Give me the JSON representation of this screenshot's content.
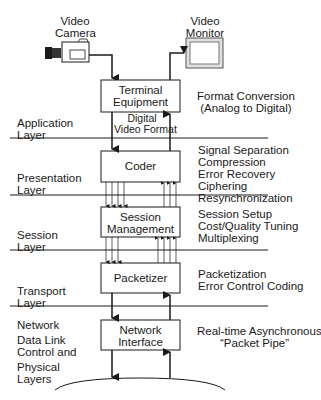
{
  "devices": {
    "camera": {
      "label_line1": "Video",
      "label_line2": "Camera",
      "icon": "video-camera-icon"
    },
    "monitor": {
      "label_line1": "Video",
      "label_line2": "Monitor",
      "icon": "video-monitor-icon"
    }
  },
  "boxes": [
    {
      "id": "terminal-equipment",
      "line1": "Terminal",
      "line2": "Equipment"
    },
    {
      "id": "coder",
      "line1": "Coder",
      "line2": ""
    },
    {
      "id": "session-management",
      "line1": "Session",
      "line2": "Management"
    },
    {
      "id": "packetizer",
      "line1": "Packetizer",
      "line2": ""
    },
    {
      "id": "network-interface",
      "line1": "Network",
      "line2": "Interface"
    }
  ],
  "connector_labels": {
    "digital_video_format_line1": "Digital",
    "digital_video_format_line2": "Video Format"
  },
  "layers": [
    {
      "line1": "Application",
      "line2": "Layer"
    },
    {
      "line1": "Presentation",
      "line2": "Layer"
    },
    {
      "line1": "Session",
      "line2": "Layer"
    },
    {
      "line1": "Transport",
      "line2": "Layer"
    },
    {
      "line1": "Network",
      "line2": "Data Link",
      "line3": "Control and",
      "line4": "Physical",
      "line5": "Layers"
    }
  ],
  "functions": {
    "terminal": [
      "Format Conversion",
      "(Analog to Digital)"
    ],
    "coder": [
      "Signal Separation",
      "Compression",
      "Error Recovery",
      "Ciphering",
      "Resynchronization"
    ],
    "session": [
      "Session Setup",
      "Cost/Quality Tuning",
      "Multiplexing"
    ],
    "packetizer": [
      "Packetization",
      "Error Control Coding"
    ],
    "network": [
      "Real-time Asynchronous",
      "“Packet Pipe”"
    ]
  },
  "colors": {
    "line": "#1a1a1a",
    "background": "#ffffff",
    "monitor_frame": "#cccccc"
  }
}
